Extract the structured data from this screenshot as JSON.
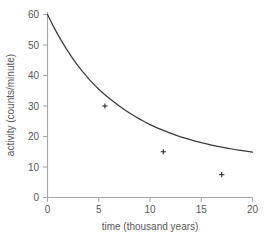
{
  "chart_data": {
    "type": "line",
    "title": "",
    "subtitle": "",
    "xlabel": "time (thousand years)",
    "ylabel": "activity (counts/minute)",
    "xlim": [
      0,
      20
    ],
    "ylim": [
      0,
      62
    ],
    "xticks": [
      0,
      5,
      10,
      15,
      20
    ],
    "yticks": [
      0,
      10,
      20,
      30,
      40,
      50,
      60
    ],
    "xtick_labels": [
      "0",
      "5",
      "10",
      "15",
      "20"
    ],
    "ytick_labels": [
      "0",
      "10",
      "20",
      "30",
      "40",
      "50",
      "60"
    ],
    "grid": false,
    "legend": null,
    "legend_position": "none",
    "series": [
      {
        "name": "activity",
        "x": [
          0,
          0.5,
          1,
          1.5,
          2,
          2.5,
          3,
          3.5,
          4,
          4.5,
          5,
          5.6,
          6,
          7,
          8,
          9,
          10,
          11.3,
          12,
          13,
          14,
          15,
          16,
          17,
          18,
          19,
          20
        ],
        "values": [
          60.0,
          56.6,
          53.5,
          50.6,
          47.9,
          45.4,
          43.1,
          41.0,
          39.0,
          37.2,
          35.5,
          33.7,
          32.6,
          30.0,
          27.7,
          25.7,
          23.9,
          22.0,
          21.1,
          19.9,
          18.9,
          18.0,
          17.2,
          16.5,
          15.9,
          15.4,
          14.9
        ]
      }
    ],
    "markers": [
      {
        "label": "first half-life",
        "x": 5.6,
        "y": 30.0
      },
      {
        "label": "second half-life",
        "x": 11.3,
        "y": 15.0
      },
      {
        "label": "third half-life",
        "x": 17.0,
        "y": 7.5
      }
    ],
    "colors": {
      "curve": "#3b3b3d",
      "axis": "#a7a9ac",
      "text": "#58595b",
      "marker": "#2b2b2d",
      "background": "#ffffff"
    }
  }
}
